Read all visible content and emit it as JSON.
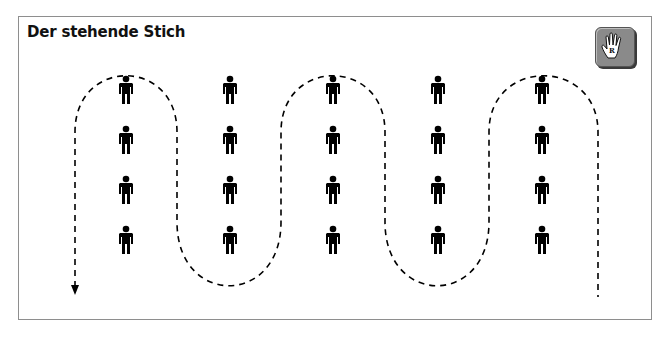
{
  "title": "Der stehende Stich",
  "badge": {
    "icon": "right-hand-icon",
    "letter": "R",
    "bg_color": "#8a8a8a"
  },
  "diagram": {
    "columns": 5,
    "rows": 4,
    "figure": "standing-person-icon",
    "path_style": "dashed serpentine line",
    "arrow_end": "downward arrow at bottom-left",
    "colors": {
      "line": "#000000",
      "figures": "#000000",
      "frame": "#8e8e8e"
    }
  }
}
